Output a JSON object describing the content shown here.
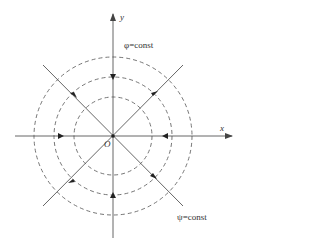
{
  "diagram": {
    "axes": {
      "x_label": "x",
      "y_label": "y",
      "origin_label": "O"
    },
    "labels": {
      "phi_const": "φ=const",
      "psi_const": "ψ=const"
    },
    "origin": [
      113,
      136
    ],
    "circle_radii": [
      39,
      59,
      79
    ],
    "colors": {
      "line": "#555555",
      "dashed": "#666666",
      "text": "#333333"
    }
  }
}
